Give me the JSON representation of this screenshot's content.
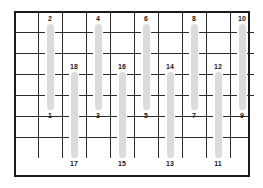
{
  "diagram": {
    "frame": {
      "x": 14,
      "y": 11,
      "width": 236,
      "height": 166,
      "border_color": "#1a1a1a",
      "border_width": 2,
      "background": "#ffffff"
    },
    "grid": {
      "line_color": "#2b2b2b",
      "line_width": 1.4,
      "row_y": [
        11,
        32,
        53,
        74,
        95,
        116,
        137,
        158
      ],
      "column_x": [
        14,
        38,
        62,
        86,
        110,
        134,
        158,
        182,
        206,
        230,
        250
      ],
      "row_count": 7,
      "column_count": 10
    },
    "bar_style": {
      "color": "#dcdcdc",
      "width": 7,
      "corner_radius": 5
    },
    "bars": [
      {
        "top_label": "2",
        "bottom_label": "1",
        "x": 50,
        "y": 24,
        "height": 86
      },
      {
        "top_label": "18",
        "bottom_label": "17",
        "x": 74,
        "y": 72,
        "height": 86
      },
      {
        "top_label": "4",
        "bottom_label": "3",
        "x": 98,
        "y": 24,
        "height": 86
      },
      {
        "top_label": "16",
        "bottom_label": "15",
        "x": 122,
        "y": 72,
        "height": 86
      },
      {
        "top_label": "6",
        "bottom_label": "5",
        "x": 146,
        "y": 24,
        "height": 86
      },
      {
        "top_label": "14",
        "bottom_label": "13",
        "x": 170,
        "y": 72,
        "height": 86
      },
      {
        "top_label": "8",
        "bottom_label": "7",
        "x": 194,
        "y": 24,
        "height": 86
      },
      {
        "top_label": "12",
        "bottom_label": "11",
        "x": 218,
        "y": 72,
        "height": 86
      },
      {
        "top_label": "10",
        "bottom_label": "9",
        "x": 242,
        "y": 24,
        "height": 86
      }
    ],
    "labels": {
      "top_row": [
        "2",
        "4",
        "6",
        "8",
        "10"
      ],
      "upper_bottom_row": [
        "1",
        "3",
        "5",
        "7",
        "9"
      ],
      "middle_row": [
        "18",
        "16",
        "14",
        "12"
      ],
      "bottom_row": [
        "17",
        "15",
        "13",
        "11"
      ],
      "all": [
        "1",
        "2",
        "3",
        "4",
        "5",
        "6",
        "7",
        "8",
        "9",
        "10",
        "11",
        "12",
        "13",
        "14",
        "15",
        "16",
        "17",
        "18"
      ]
    }
  }
}
